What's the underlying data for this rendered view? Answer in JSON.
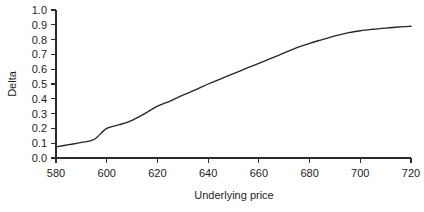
{
  "chart_data": {
    "type": "line",
    "title": "",
    "xlabel": "Underlying price",
    "ylabel": "Delta",
    "xlim": [
      580,
      720
    ],
    "ylim": [
      0.0,
      1.0
    ],
    "grid": false,
    "legend": false,
    "legend_position": "none",
    "line_color": "#262626",
    "background_color": "#ffffff",
    "xticks": [
      580,
      600,
      620,
      640,
      660,
      680,
      700,
      720
    ],
    "xtick_labels": [
      "580",
      "600",
      "620",
      "640",
      "660",
      "680",
      "700",
      "720"
    ],
    "yticks": [
      0.0,
      0.1,
      0.2,
      0.3,
      0.4,
      0.5,
      0.6,
      0.7,
      0.8,
      0.9,
      1.0
    ],
    "ytick_labels": [
      "0.0",
      "0.1",
      "0.2",
      "0.3",
      "0.4",
      "0.5",
      "0.6",
      "0.7",
      "0.8",
      "0.9",
      "1.0"
    ],
    "series": [
      {
        "name": "Delta",
        "x": [
          580,
          585,
          590,
          595,
          600,
          605,
          610,
          615,
          620,
          625,
          630,
          635,
          640,
          645,
          650,
          655,
          660,
          665,
          670,
          675,
          680,
          685,
          690,
          695,
          700,
          705,
          710,
          715,
          720
        ],
        "values": [
          0.075,
          0.09,
          0.105,
          0.125,
          0.2,
          0.225,
          0.255,
          0.3,
          0.35,
          0.385,
          0.425,
          0.46,
          0.5,
          0.535,
          0.57,
          0.605,
          0.64,
          0.675,
          0.71,
          0.745,
          0.775,
          0.8,
          0.825,
          0.845,
          0.86,
          0.87,
          0.878,
          0.885,
          0.89
        ]
      }
    ]
  },
  "axes": {
    "y_title": "Delta",
    "x_title": "Underlying price"
  }
}
